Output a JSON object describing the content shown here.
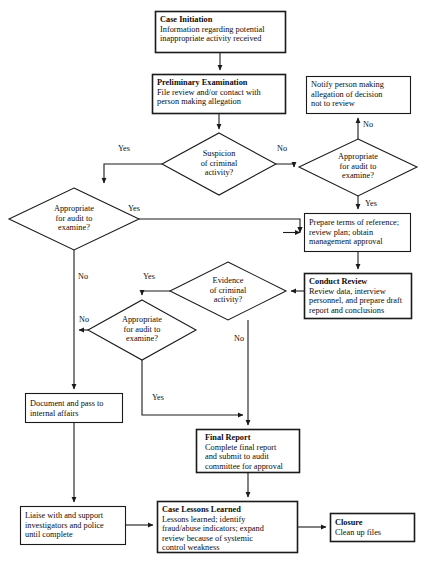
{
  "diagram": {
    "colors": {
      "background": "#ffffff",
      "stroke": "#1a1a1a",
      "text": "#0d0d0d"
    },
    "nodes": [
      {
        "id": "case-initiation",
        "shape": "box",
        "emphasis": "thick",
        "title": "Case Initiation",
        "body": "Information regarding potential inappropriate activity received"
      },
      {
        "id": "preliminary-examination",
        "shape": "box",
        "emphasis": "thick",
        "title": "Preliminary Examination",
        "body": "File review and/or contact with person making allegation"
      },
      {
        "id": "suspicion-of-criminal-activity",
        "shape": "diamond",
        "title": "",
        "body": "Suspicion of criminal activity?"
      },
      {
        "id": "appropriate-for-audit-right",
        "shape": "diamond",
        "title": "",
        "body": "Appropriate for audit to examine?"
      },
      {
        "id": "notify-person",
        "shape": "box",
        "emphasis": "normal",
        "title": "",
        "body": "Notify person making allegation of decision not to review"
      },
      {
        "id": "appropriate-for-audit-left",
        "shape": "diamond",
        "title": "",
        "body": "Appropriate for audit to examine?"
      },
      {
        "id": "prepare-terms-of-reference",
        "shape": "box",
        "emphasis": "normal",
        "title": "",
        "body": "Prepare terms of reference; review plan; obtain management approval"
      },
      {
        "id": "conduct-review",
        "shape": "box",
        "emphasis": "thick",
        "title": "Conduct Review",
        "body": "Review data, interview personnel, and prepare draft report and conclusions"
      },
      {
        "id": "evidence-of-criminal-activity",
        "shape": "diamond",
        "title": "",
        "body": "Evidence of criminal activity?"
      },
      {
        "id": "appropriate-for-audit-mid",
        "shape": "diamond",
        "title": "",
        "body": "Appropriate for audit to examine?"
      },
      {
        "id": "document-and-pass",
        "shape": "box",
        "emphasis": "normal",
        "title": "",
        "body": "Document and pass to internal affairs"
      },
      {
        "id": "final-report",
        "shape": "box",
        "emphasis": "thick",
        "title": "Final Report",
        "body": "Complete final report and submit to audit committee for approval"
      },
      {
        "id": "liaise-with-investigators",
        "shape": "box",
        "emphasis": "normal",
        "title": "",
        "body": "Liaise with and support investigators and police until complete"
      },
      {
        "id": "case-lessons-learned",
        "shape": "box",
        "emphasis": "thick",
        "title": "Case Lessons Learned",
        "body": "Lessons learned; identify fraud/abuse indicators; expand review because of systemic control weakness"
      },
      {
        "id": "closure",
        "shape": "box",
        "emphasis": "thick",
        "title": "Closure",
        "body": "Clean up files"
      }
    ],
    "edge_labels": {
      "suspicion_yes": "Yes",
      "suspicion_no": "No",
      "audit_right_no": "No",
      "audit_right_yes": "Yes",
      "audit_left_yes": "Yes",
      "audit_left_no": "No",
      "evidence_yes": "Yes",
      "evidence_no": "No",
      "audit_mid_no": "No",
      "audit_mid_yes": "Yes"
    },
    "text": {
      "case_initiation_title": "Case Initiation",
      "case_initiation_l1": "Information regarding potential",
      "case_initiation_l2": "inappropriate activity received",
      "preliminary_title": "Preliminary Examination",
      "preliminary_l1": "File review and/or contact with",
      "preliminary_l2": "person making allegation",
      "suspicion_l1": "Suspicion",
      "suspicion_l2": "of criminal",
      "suspicion_l3": "activity?",
      "notify_l1": "Notify person making",
      "notify_l2": "allegation of decision",
      "notify_l3": "not to review",
      "audit_right_l1": "Appropriate",
      "audit_right_l2": "for audit to",
      "audit_right_l3": "examine?",
      "audit_left_l1": "Appropriate",
      "audit_left_l2": "for audit to",
      "audit_left_l3": "examine?",
      "prepare_l1": "Prepare terms of reference;",
      "prepare_l2": "review plan; obtain",
      "prepare_l3": "management approval",
      "conduct_title": "Conduct Review",
      "conduct_l1": "Review data, interview",
      "conduct_l2": "personnel, and prepare draft",
      "conduct_l3": "report and conclusions",
      "evidence_l1": "Evidence",
      "evidence_l2": "of criminal",
      "evidence_l3": "activity?",
      "audit_mid_l1": "Appropriate",
      "audit_mid_l2": "for audit to",
      "audit_mid_l3": "examine?",
      "document_l1": "Document and pass to",
      "document_l2": "internal affairs",
      "final_title": "Final Report",
      "final_l1": "Complete final report",
      "final_l2": "and submit to audit",
      "final_l3": "committee for approval",
      "liaise_l1": "Liaise with and support",
      "liaise_l2": "investigators and police",
      "liaise_l3": "until complete",
      "lessons_title": "Case Lessons Learned",
      "lessons_l1": "Lessons learned; identify",
      "lessons_l2": "fraud/abuse indicators; expand",
      "lessons_l3": "review because of systemic",
      "lessons_l4": "control weakness",
      "closure_title": "Closure",
      "closure_l1": "Clean up files"
    }
  }
}
